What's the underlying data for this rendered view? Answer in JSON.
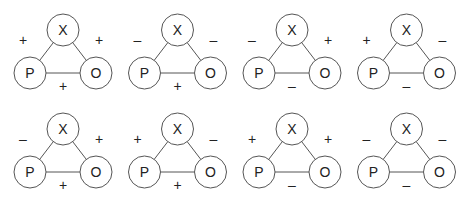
{
  "diagram": {
    "node_labels": {
      "p": "P",
      "o": "O",
      "x": "X"
    },
    "colors": {
      "stroke": "#555555",
      "text": "#222222",
      "background": "#ffffff"
    },
    "triads": [
      {
        "row": 0,
        "col": 0,
        "px": "+",
        "ox": "+",
        "po": "+"
      },
      {
        "row": 0,
        "col": 1,
        "px": "–",
        "ox": "–",
        "po": "+"
      },
      {
        "row": 0,
        "col": 2,
        "px": "–",
        "ox": "+",
        "po": "–"
      },
      {
        "row": 0,
        "col": 3,
        "px": "+",
        "ox": "–",
        "po": "–"
      },
      {
        "row": 1,
        "col": 0,
        "px": "–",
        "ox": "+",
        "po": "+"
      },
      {
        "row": 1,
        "col": 1,
        "px": "+",
        "ox": "–",
        "po": "+"
      },
      {
        "row": 1,
        "col": 2,
        "px": "+",
        "ox": "+",
        "po": "–"
      },
      {
        "row": 1,
        "col": 3,
        "px": "–",
        "ox": "–",
        "po": "–"
      }
    ]
  }
}
